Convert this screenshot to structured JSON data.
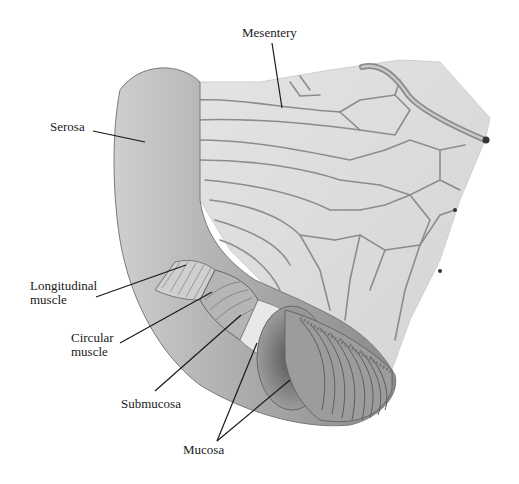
{
  "diagram": {
    "labels": {
      "mesentery": "Mesentery",
      "serosa": "Serosa",
      "longitudinal_muscle": "Longitudinal\nmuscle",
      "circular_muscle": "Circular\nmuscle",
      "submucosa": "Submucosa",
      "mucosa": "Mucosa"
    },
    "colors": {
      "background": "#ffffff",
      "tissue_light": "#e6e6e6",
      "tissue_mid": "#bdbdbd",
      "tissue_dark": "#7a7a7a",
      "vessel": "#8c8c8c",
      "leader_line": "#1a1a1a"
    }
  }
}
